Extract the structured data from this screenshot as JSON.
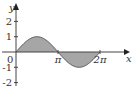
{
  "chart_data": {
    "type": "area",
    "title": "",
    "function": "y = sin(x)",
    "xlabel": "x",
    "ylabel": "y",
    "xlim": [
      0,
      6.8
    ],
    "ylim": [
      -2,
      2.8
    ],
    "x_ticks": [
      {
        "value": 3.14159,
        "label": "π"
      },
      {
        "value": 6.28318,
        "label": "2π"
      }
    ],
    "y_ticks": [
      {
        "value": 2,
        "label": "2"
      },
      {
        "value": 1,
        "label": "1"
      },
      {
        "value": -1,
        "label": "-1"
      },
      {
        "value": -2,
        "label": "-2"
      }
    ],
    "origin_label": "0",
    "shaded_region": {
      "from": 0,
      "to": 6.28318,
      "between": "curve and x-axis"
    },
    "fill_color": "#a6a6a6",
    "line_color": "#555555",
    "grid": false,
    "legend": "none"
  }
}
